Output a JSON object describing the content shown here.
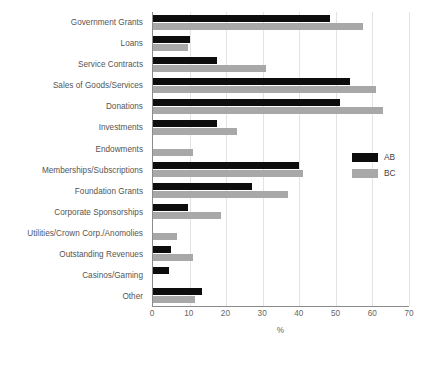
{
  "chart_data": {
    "type": "bar",
    "orientation": "horizontal",
    "title": "",
    "xlabel": "%",
    "ylabel": "",
    "xlim": [
      0,
      70
    ],
    "xticks": [
      0,
      10,
      20,
      30,
      40,
      50,
      60,
      70
    ],
    "grid": true,
    "legend_position": "right",
    "categories": [
      "Government Grants",
      "Loans",
      "Service Contracts",
      "Sales of Goods/Services",
      "Donations",
      "Investments",
      "Endowments",
      "Memberships/Subscriptions",
      "Foundation Grants",
      "Corporate Sponsorships",
      "Utilities/Crown Corp./Anomolies",
      "Outstanding Revenues",
      "Casinos/Gaming",
      "Other"
    ],
    "series": [
      {
        "name": "AB",
        "color": "#0d0d0d",
        "values": [
          48.5,
          10,
          17.5,
          54,
          51,
          17.5,
          0,
          40,
          27,
          9.5,
          0,
          5,
          4.5,
          13.5
        ]
      },
      {
        "name": "BC",
        "color": "#a8a8a8",
        "values": [
          57.5,
          9.5,
          31,
          61,
          63,
          23,
          11,
          41,
          37,
          18.5,
          6.5,
          11,
          0,
          11.5
        ]
      }
    ]
  }
}
